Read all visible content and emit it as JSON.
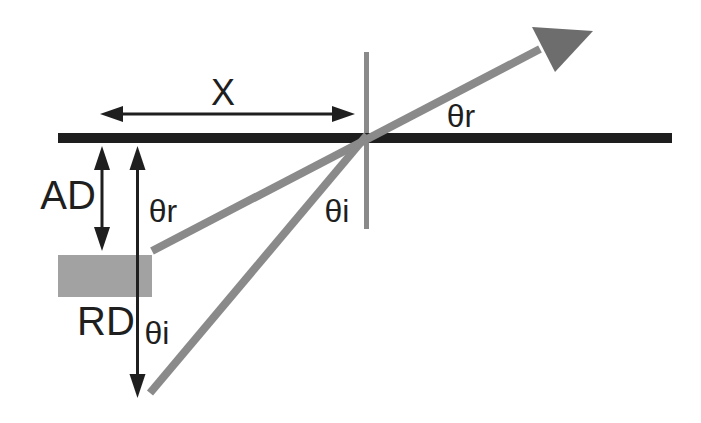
{
  "figure": {
    "labels": {
      "lateral_offset": "X",
      "actual_distance": "AD",
      "reference_distance": "RD",
      "reflection_angle": "θr",
      "incidence_angle": "θi"
    },
    "colors": {
      "background": "#ffffff",
      "surface_line": "#1e1e1e",
      "dimension_arrows_and_text": "#1f1f1f",
      "rays_and_normal": "#8a8a8a",
      "ray_arrowhead": "#6d6d6d",
      "detector_box": "#a2a2a2"
    }
  }
}
